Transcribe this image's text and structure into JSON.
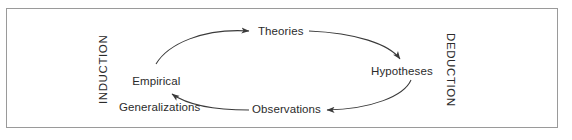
{
  "diagram": {
    "frame": {
      "border_color": "#9a9a9a"
    },
    "line_color": "#3a3a3a",
    "text_color": "#2b2b2b",
    "nodes": [
      {
        "id": "theories",
        "label": "Theories"
      },
      {
        "id": "hypotheses",
        "label": "Hypotheses"
      },
      {
        "id": "observations",
        "label": "Observations"
      },
      {
        "id": "empirical_generalizations",
        "label_line1": "Empirical",
        "label_line2": "Generalizations"
      }
    ],
    "side_labels": [
      {
        "id": "induction",
        "label": "INDUCTION",
        "rotation": -90
      },
      {
        "id": "deduction",
        "label": "DEDUCTION",
        "rotation": 90
      }
    ],
    "arrows": [
      {
        "id": "empirical-to-theories",
        "from": "Empirical Generalizations",
        "to": "Theories",
        "direction": "clockwise"
      },
      {
        "id": "theories-to-hypotheses",
        "from": "Theories",
        "to": "Hypotheses",
        "direction": "clockwise"
      },
      {
        "id": "hypotheses-to-observations",
        "from": "Hypotheses",
        "to": "Observations",
        "direction": "clockwise"
      },
      {
        "id": "observations-to-empirical",
        "from": "Observations",
        "to": "Empirical Generalizations",
        "direction": "clockwise"
      }
    ]
  }
}
